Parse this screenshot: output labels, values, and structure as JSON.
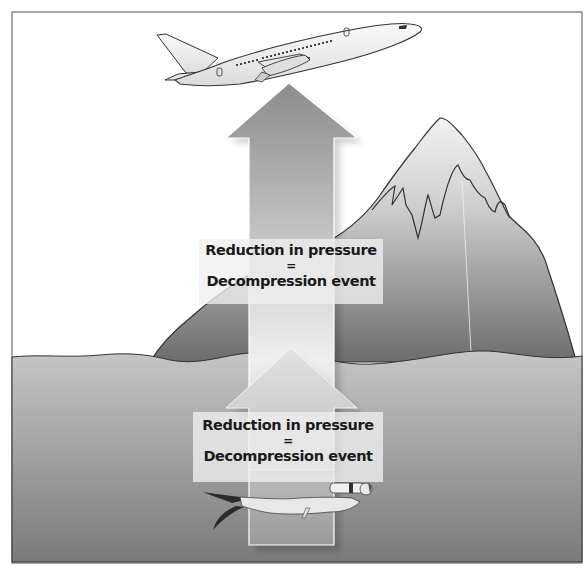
{
  "diagram": {
    "title": "",
    "labels": {
      "upper": {
        "line1": "Reduction in pressure",
        "line2": "=",
        "line3": "Decompression event"
      },
      "lower": {
        "line1": "Reduction in pressure",
        "line2": "=",
        "line3": "Decompression event"
      }
    },
    "elements": [
      {
        "name": "airplane",
        "description": "Jet airliner climbing at top"
      },
      {
        "name": "large-up-arrow",
        "description": "Large gray arrow from sea floor to airplane"
      },
      {
        "name": "mountain",
        "description": "Snow-capped mountain on right"
      },
      {
        "name": "small-up-arrow",
        "description": "Small arrow from diver up to water surface"
      },
      {
        "name": "sea",
        "description": "Water body occupying lower half"
      },
      {
        "name": "diver",
        "description": "Scuba diver swimming near the bottom"
      }
    ],
    "colors": {
      "background": "#ffffff",
      "frame": "#555555",
      "sea_top": "#c9c9c9",
      "sea_bottom": "#7d7d7d",
      "mountain_top": "#f4f4f4",
      "mountain_bottom": "#6e6e6e",
      "arrow_large_top": "#8a8a8a",
      "arrow_large_bottom": "#ececec",
      "arrow_small": "#dcdcdc",
      "text": "#1a1a1a"
    }
  }
}
